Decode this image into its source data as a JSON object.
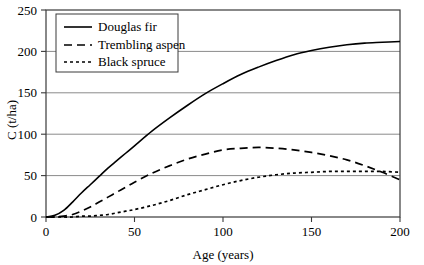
{
  "chart_data": {
    "type": "line",
    "title": "",
    "xlabel": "Age (years)",
    "ylabel": "C (t/ha)",
    "xlim": [
      0,
      200
    ],
    "ylim": [
      0,
      250
    ],
    "xticks": [
      0,
      50,
      100,
      150,
      200
    ],
    "yticks": [
      0,
      50,
      100,
      150,
      200,
      250
    ],
    "xtick_labels": [
      "0",
      "50",
      "100",
      "150",
      "200"
    ],
    "ytick_labels": [
      "0",
      "50",
      "100",
      "150",
      "200",
      "250"
    ],
    "grid": "horizontal",
    "legend_position": "top-left",
    "x": [
      0,
      5,
      10,
      15,
      20,
      25,
      30,
      35,
      40,
      45,
      50,
      60,
      70,
      80,
      90,
      100,
      110,
      120,
      130,
      140,
      150,
      160,
      170,
      180,
      190,
      200
    ],
    "series": [
      {
        "name": "Douglas fir",
        "style": "solid",
        "color": "#000000",
        "values": [
          0,
          2,
          8,
          18,
          29,
          39,
          49,
          59,
          68,
          77,
          86,
          104,
          120,
          135,
          149,
          161,
          172,
          181,
          189,
          196,
          201,
          205,
          208,
          210,
          211,
          212
        ]
      },
      {
        "name": "Trembling aspen",
        "style": "dashed",
        "color": "#000000",
        "values": [
          0,
          0,
          1,
          3,
          7,
          12,
          18,
          24,
          30,
          36,
          42,
          53,
          62,
          70,
          76,
          81,
          83,
          84,
          83,
          81,
          78,
          74,
          69,
          62,
          54,
          45
        ]
      },
      {
        "name": "Black spruce",
        "style": "dotted",
        "color": "#000000",
        "values": [
          0,
          0,
          0,
          0,
          1,
          1,
          2,
          3,
          5,
          7,
          9,
          14,
          20,
          27,
          33,
          39,
          44,
          48,
          51,
          53,
          54,
          55,
          55,
          55,
          55,
          54
        ]
      }
    ],
    "annotations": []
  },
  "legend": {
    "entries": [
      {
        "label": "Douglas fir",
        "swatch": "solid-line-swatch"
      },
      {
        "label": "Trembling aspen",
        "swatch": "dashed-line-swatch"
      },
      {
        "label": "Black spruce",
        "swatch": "dotted-line-swatch"
      }
    ]
  },
  "axes": {
    "y_title": "C (t/ha)",
    "x_title": "Age (years)"
  }
}
